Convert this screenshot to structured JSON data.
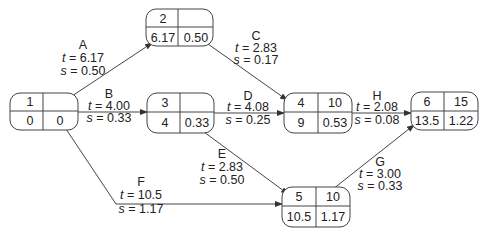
{
  "diagram": {
    "type": "PERT network",
    "nodes": [
      {
        "id": "1",
        "label": "1",
        "top_right": "",
        "bottom_left": "0",
        "bottom_right": "0"
      },
      {
        "id": "2",
        "label": "2",
        "top_right": "",
        "bottom_left": "6.17",
        "bottom_right": "0.50"
      },
      {
        "id": "3",
        "label": "3",
        "top_right": "",
        "bottom_left": "4",
        "bottom_right": "0.33"
      },
      {
        "id": "4",
        "label": "4",
        "top_right": "10",
        "bottom_left": "9",
        "bottom_right": "0.53"
      },
      {
        "id": "5",
        "label": "5",
        "top_right": "10",
        "bottom_left": "10.5",
        "bottom_right": "1.17"
      },
      {
        "id": "6",
        "label": "6",
        "top_right": "15",
        "bottom_left": "13.5",
        "bottom_right": "1.22"
      }
    ],
    "activities": [
      {
        "name": "A",
        "from": "1",
        "to": "2",
        "t": "6.17",
        "s": "0.50"
      },
      {
        "name": "B",
        "from": "1",
        "to": "3",
        "t": "4.00",
        "s": "0.33"
      },
      {
        "name": "C",
        "from": "2",
        "to": "4",
        "t": "2.83",
        "s": "0.17"
      },
      {
        "name": "D",
        "from": "3",
        "to": "4",
        "t": "4.08",
        "s": "0.25"
      },
      {
        "name": "E",
        "from": "3",
        "to": "5",
        "t": "2.83",
        "s": "0.50"
      },
      {
        "name": "F",
        "from": "1",
        "to": "5",
        "t": "10.5",
        "s": "1.17"
      },
      {
        "name": "G",
        "from": "5",
        "to": "6",
        "t": "3.00",
        "s": "0.33"
      },
      {
        "name": "H",
        "from": "4",
        "to": "6",
        "t": "2.08",
        "s": "0.08"
      }
    ],
    "labels": {
      "t_prefix": "t",
      "s_prefix": "s",
      "equals": " = "
    }
  }
}
